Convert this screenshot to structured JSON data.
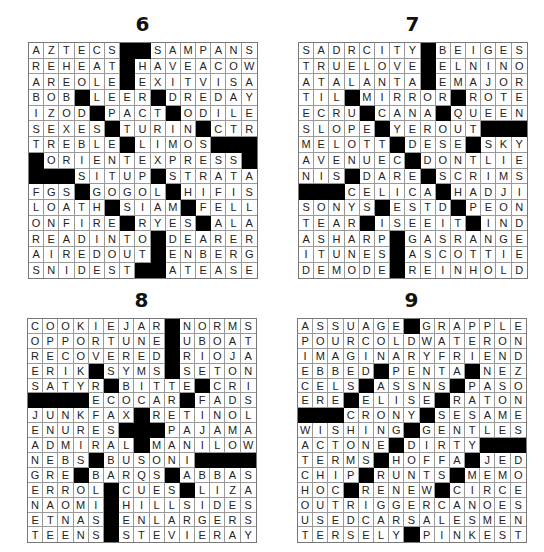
{
  "puzzles": [
    {
      "number": "6",
      "rows": [
        "AZTECS##SAMPANS",
        "REHEAT#HAVEACOW",
        "AREOLE#EXITVISA",
        "BOB#LEER#DREDAY",
        "IZOD#PACT#ODILE",
        "SEXES#TURIN#CTR",
        "TREBLE#LIMOS###",
        "#ORIENTEXPRESS#",
        "###SITUP#STRATA",
        "FGS#GOGOL#HIFIS",
        "LOATH#SIAM#FELL",
        "ONFIRE#RYES#ALA",
        "READINTO#DEARER",
        "AIREDOUT#ENBERG",
        "SNIDEST##ATEASE"
      ]
    },
    {
      "number": "7",
      "rows": [
        "SADRCITY#BEIGES",
        "TRUELOVE#ELNINO",
        "ATALANTA#EMAJOR",
        "TIL#MIRROR#ROTE",
        "ECRU#CANA#QUEEN",
        "SLOPE#YEROUT###",
        "MELOTT#DESE#SKY",
        "AVENUEC#DONTLIE",
        "NIS#DARE#SCRIMS",
        "###CELICA#HADJI",
        "SONYS#ESTD#PEON",
        "TEAR#ISEEIT#IND",
        "ASHARP#GASRANGE",
        "ITUNES#ASCOTTIE",
        "DEMODE#REINHOLD"
      ]
    },
    {
      "number": "8",
      "rows": [
        "COOKIEJAR#NORMS",
        "OPPORTUNE#UBOAT",
        "RECOVERED#RIOJA",
        "ERIK#SYMS#SETON",
        "SATYR#BITTE#CRI",
        "####ECOCAR#FADS",
        "JUNKFAX#RETINOL",
        "ENURES###PAJAMA",
        "ADMIRAL#MANILOW",
        "NEBS#BUSONI####",
        "GRE#BARQS#ABBAS",
        "ERROL#CUES#LIZA",
        "NAOMI#HILLSIDES",
        "ETNAS#ENLARGERS",
        "TEENS#STEVIERAY"
      ]
    },
    {
      "number": "9",
      "rows": [
        "ASSUAGE#GRAPPLE",
        "POURCOLDWATERON",
        "IMAGINARYFRIEND",
        "EBBED#PENTA#NEZ",
        "CELS#ASSNS#PASO",
        "ERE#ELISE#RATON",
        "###CRONY#SESAME",
        "WISHING#GENTLES",
        "ACTONE#DIRTY###",
        "TERMS#HOFFA#JED",
        "CHIP#RUNTS#MEMO",
        "HOC#RENEW#CIRCE",
        "OUTRIGGERCANOES",
        "USEDCARSALESMEN",
        "TERSELY#PINKEST"
      ]
    }
  ]
}
